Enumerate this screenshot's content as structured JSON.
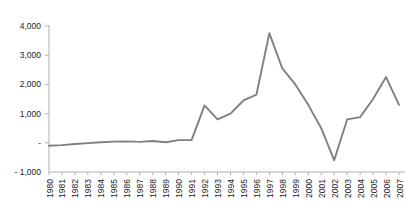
{
  "chart_data": {
    "type": "line",
    "title": "",
    "subtitle": "",
    "xlabel": "",
    "ylabel": "",
    "grid": false,
    "legend": "none",
    "line_color": "#808080",
    "axis_color": "#b0b0b0",
    "text_color": "#222222",
    "ylim": [
      -1000,
      4000
    ],
    "ytick_values": [
      -1000,
      0,
      1000,
      2000,
      3000,
      4000
    ],
    "ytick_labels": [
      "- 1,000",
      "-",
      "1,000",
      "2,000",
      "3,000",
      "4,000"
    ],
    "categories": [
      "1980",
      "1981",
      "1982",
      "1983",
      "1984",
      "1985",
      "1986",
      "1987",
      "1988",
      "1989",
      "1990",
      "1991",
      "1992",
      "1993",
      "1994",
      "1995",
      "1996",
      "1997",
      "1998",
      "1999",
      "2000",
      "2001",
      "2002",
      "2003",
      "2004",
      "2005",
      "2006",
      "2007"
    ],
    "values": [
      -100,
      -80,
      -40,
      -10,
      20,
      40,
      50,
      30,
      60,
      20,
      90,
      90,
      1280,
      800,
      1000,
      1450,
      1650,
      3750,
      2550,
      2000,
      1300,
      500,
      -600,
      800,
      880,
      1500,
      2250,
      1300
    ]
  }
}
